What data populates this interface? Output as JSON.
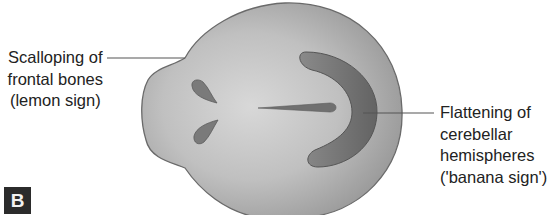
{
  "figure": {
    "panel_label": "B",
    "colors": {
      "background": "#ffffff",
      "head_fill_center": "#d2d2d2",
      "head_fill_edge": "#9a9a9a",
      "head_outline": "#6a6a6a",
      "banana_fill": "#6e6e6e",
      "ventricle_fill": "#777777",
      "midline_fill": "#707070",
      "callout_line": "#555555",
      "text": "#222222",
      "panel_tag_bg": "#2b2b2b",
      "panel_tag_text": "#f2f2f2"
    },
    "structures": [
      {
        "name": "fetal-head",
        "description": "Lemon-shaped fetal skull outline"
      },
      {
        "name": "cerebellum",
        "description": "Banana-shaped curved cerebellar hemispheres"
      },
      {
        "name": "lateral-ventricles",
        "description": "Two teardrop-shaped frontal horns"
      },
      {
        "name": "midline-falx",
        "description": "Midline echo"
      }
    ],
    "annotations": {
      "left": {
        "lines": [
          "Scalloping of",
          "frontal bones",
          "(lemon sign)"
        ],
        "target": "frontal-bone-notch"
      },
      "right": {
        "lines": [
          "Flattening of",
          "cerebellar",
          "hemispheres",
          "('banana sign')"
        ],
        "target": "cerebellum"
      }
    }
  }
}
